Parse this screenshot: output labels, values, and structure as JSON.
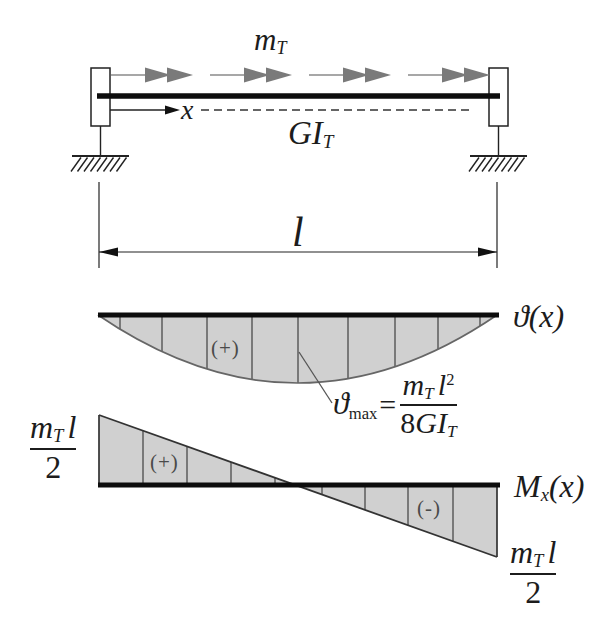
{
  "beam": {
    "load_label": {
      "base": "m",
      "sub": "T"
    },
    "axis_label": "x",
    "stiffness_label": {
      "base": "GI",
      "sub": "T"
    },
    "length_label": "l"
  },
  "twist_diagram": {
    "label": "ϑ(x)",
    "sign": "(+)",
    "max_formula": {
      "lhs_base": "ϑ",
      "lhs_sub": "max",
      "equals": "=",
      "num_base": "m",
      "num_sub": "T",
      "num_var": "l",
      "num_exp": "2",
      "den_coeff": "8",
      "den_var": "GI",
      "den_sub": "T"
    }
  },
  "moment_diagram": {
    "label_base": "M",
    "label_sub": "x",
    "label_arg": "(x)",
    "sign_positive": "(+)",
    "sign_negative": "(-)",
    "left_value": {
      "num_base": "m",
      "num_sub": "T",
      "num_var": "l",
      "den": "2"
    },
    "right_value": {
      "num_base": "m",
      "num_sub": "T",
      "num_var": "l",
      "den": "2"
    }
  },
  "colors": {
    "diagram_fill": "#d0d0d0",
    "arrow_gray": "#7a7a7a",
    "ink": "#111111",
    "sign_gray": "#4a4a4a"
  }
}
